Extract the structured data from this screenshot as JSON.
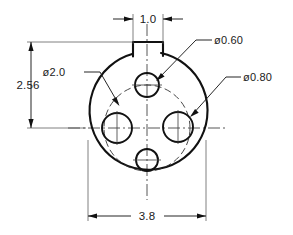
{
  "drawing": {
    "title": "Flanged disc with locating tab - 4 hole bolt pattern",
    "units_note": "",
    "line_color": "#111111",
    "background_color": "#ffffff",
    "thin_line_color": "#555555",
    "centerline_color": "#444444"
  },
  "dimensions": {
    "tab_width": {
      "label": "1.0",
      "name": "tab-width-dimension",
      "orientation": "horizontal",
      "position": "top"
    },
    "tab_height_overall": {
      "label": "2.56",
      "name": "overall-height-dimension",
      "orientation": "vertical",
      "position": "left"
    },
    "outer_diameter": {
      "label": "3.8",
      "name": "outer-width-dimension",
      "orientation": "horizontal",
      "position": "bottom"
    }
  },
  "callouts": [
    {
      "label": "ø2.0",
      "name": "bolt-circle-diameter-callout",
      "target": "bolt-circle",
      "text_x": 54,
      "text_y": 76
    },
    {
      "label": "ø0.60",
      "name": "small-hole-diameter-callout",
      "target": "top-hole",
      "text_x": 213,
      "text_y": 44
    },
    {
      "label": "ø0.80",
      "name": "large-hole-diameter-callout",
      "target": "right-hole",
      "text_x": 242,
      "text_y": 81
    }
  ],
  "geometry": {
    "body_circle": {
      "name": "main-body-circle",
      "cx": 147,
      "cy": 128,
      "r": 59
    },
    "bolt_circle": {
      "name": "bolt-circle-dashed",
      "cx": 147,
      "cy": 128,
      "r": 43
    },
    "tab": {
      "name": "locating-tab",
      "left_x": 133,
      "right_x": 163,
      "top_y": 42
    },
    "holes": [
      {
        "name": "hole-top",
        "cx": 147,
        "cy": 85,
        "r": 12,
        "size_label": "ø0.60"
      },
      {
        "name": "hole-left",
        "cx": 117,
        "cy": 128,
        "r": 15,
        "size_label": "ø0.80"
      },
      {
        "name": "hole-right",
        "cx": 178,
        "cy": 127,
        "r": 15,
        "size_label": "ø0.80"
      },
      {
        "name": "hole-bottom",
        "cx": 147,
        "cy": 160,
        "r": 11,
        "size_label": "ø0.60"
      }
    ]
  }
}
